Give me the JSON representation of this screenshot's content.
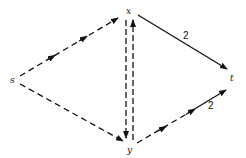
{
  "diagram": {
    "type": "directed-graph",
    "nodes": [
      {
        "id": "s",
        "label": "s",
        "x": 15,
        "y": 80
      },
      {
        "id": "x",
        "label": "x",
        "x": 129,
        "y": 12
      },
      {
        "id": "y",
        "label": "y",
        "x": 130,
        "y": 146
      },
      {
        "id": "t",
        "label": "t",
        "x": 233,
        "y": 78
      }
    ],
    "edges": [
      {
        "from": "s",
        "to": "x",
        "style": "dashed",
        "weight": ""
      },
      {
        "from": "s",
        "to": "y",
        "style": "dashed",
        "weight": ""
      },
      {
        "from": "x",
        "to": "y",
        "style": "dashed",
        "weight": ""
      },
      {
        "from": "y",
        "to": "x",
        "style": "dashed",
        "weight": ""
      },
      {
        "from": "x",
        "to": "t",
        "style": "solid",
        "weight": "2"
      },
      {
        "from": "y",
        "to": "t",
        "style": "dashed-then-solid",
        "weight": "2"
      }
    ],
    "weights": {
      "x_t": "2",
      "y_t": "2"
    },
    "colors": {
      "stroke": "#111111",
      "background": "#ffffff"
    }
  }
}
